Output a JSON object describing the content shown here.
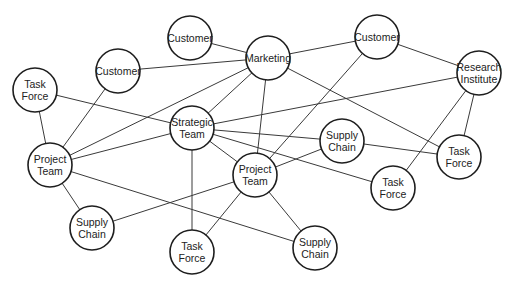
{
  "diagram": {
    "type": "network",
    "nodes": [
      {
        "id": "customer-top",
        "lines": [
          "Customer"
        ],
        "x": 190,
        "y": 38,
        "r": 22
      },
      {
        "id": "marketing",
        "lines": [
          "Marketing"
        ],
        "x": 268,
        "y": 58,
        "r": 22
      },
      {
        "id": "customer-right",
        "lines": [
          "Customer"
        ],
        "x": 377,
        "y": 37,
        "r": 22
      },
      {
        "id": "research-institute",
        "lines": [
          "Research",
          "Institute"
        ],
        "x": 479,
        "y": 73,
        "r": 22
      },
      {
        "id": "task-force-left",
        "lines": [
          "Task",
          "Force"
        ],
        "x": 35,
        "y": 90,
        "r": 22
      },
      {
        "id": "customer-left",
        "lines": [
          "Customer"
        ],
        "x": 118,
        "y": 71,
        "r": 22
      },
      {
        "id": "strategic-team",
        "lines": [
          "Strategic",
          "Team"
        ],
        "x": 192,
        "y": 128,
        "r": 22
      },
      {
        "id": "supply-chain-mid",
        "lines": [
          "Supply",
          "Chain"
        ],
        "x": 342,
        "y": 141,
        "r": 22
      },
      {
        "id": "task-force-right",
        "lines": [
          "Task",
          "Force"
        ],
        "x": 459,
        "y": 157,
        "r": 22
      },
      {
        "id": "project-team-left",
        "lines": [
          "Project",
          "Team"
        ],
        "x": 50,
        "y": 165,
        "r": 22
      },
      {
        "id": "project-team-center",
        "lines": [
          "Project",
          "Team"
        ],
        "x": 255,
        "y": 175,
        "r": 22
      },
      {
        "id": "task-force-lower",
        "lines": [
          "Task",
          "Force"
        ],
        "x": 393,
        "y": 188,
        "r": 22
      },
      {
        "id": "supply-chain-left",
        "lines": [
          "Supply",
          "Chain"
        ],
        "x": 92,
        "y": 228,
        "r": 22
      },
      {
        "id": "task-force-bottom",
        "lines": [
          "Task",
          "Force"
        ],
        "x": 192,
        "y": 252,
        "r": 22
      },
      {
        "id": "supply-chain-bottom",
        "lines": [
          "Supply",
          "Chain"
        ],
        "x": 315,
        "y": 248,
        "r": 22
      }
    ],
    "edges": [
      [
        "customer-top",
        "marketing"
      ],
      [
        "customer-left",
        "marketing"
      ],
      [
        "marketing",
        "customer-right"
      ],
      [
        "customer-right",
        "research-institute"
      ],
      [
        "marketing",
        "project-team-left"
      ],
      [
        "marketing",
        "strategic-team"
      ],
      [
        "marketing",
        "project-team-center"
      ],
      [
        "marketing",
        "task-force-right"
      ],
      [
        "customer-right",
        "project-team-center"
      ],
      [
        "research-institute",
        "strategic-team"
      ],
      [
        "research-institute",
        "task-force-right"
      ],
      [
        "research-institute",
        "task-force-lower"
      ],
      [
        "task-force-left",
        "strategic-team"
      ],
      [
        "task-force-left",
        "project-team-left"
      ],
      [
        "customer-left",
        "project-team-left"
      ],
      [
        "strategic-team",
        "project-team-left"
      ],
      [
        "strategic-team",
        "supply-chain-mid"
      ],
      [
        "strategic-team",
        "project-team-center"
      ],
      [
        "strategic-team",
        "task-force-lower"
      ],
      [
        "strategic-team",
        "task-force-bottom"
      ],
      [
        "supply-chain-mid",
        "task-force-right"
      ],
      [
        "supply-chain-mid",
        "project-team-center"
      ],
      [
        "project-team-left",
        "supply-chain-left"
      ],
      [
        "project-team-left",
        "supply-chain-bottom"
      ],
      [
        "project-team-center",
        "supply-chain-left"
      ],
      [
        "project-team-center",
        "task-force-bottom"
      ],
      [
        "project-team-center",
        "supply-chain-bottom"
      ]
    ]
  }
}
